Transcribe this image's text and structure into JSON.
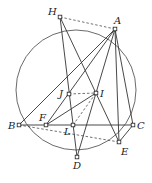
{
  "diagram": {
    "circle": {
      "cx": 76,
      "cy": 90,
      "r": 60
    },
    "points": [
      {
        "id": "H",
        "label": "H",
        "x": 60,
        "y": 17,
        "lx": 48,
        "ly": 15
      },
      {
        "id": "A",
        "label": "A",
        "x": 115,
        "y": 29,
        "lx": 114,
        "ly": 24
      },
      {
        "id": "J",
        "label": "J",
        "x": 69,
        "y": 94,
        "lx": 59,
        "ly": 97
      },
      {
        "id": "I",
        "label": "I",
        "x": 96,
        "y": 93,
        "lx": 100,
        "ly": 97
      },
      {
        "id": "B",
        "label": "B",
        "x": 19,
        "y": 125,
        "lx": 8,
        "ly": 129
      },
      {
        "id": "F",
        "label": "F",
        "x": 46,
        "y": 125,
        "lx": 39,
        "ly": 121
      },
      {
        "id": "L",
        "label": "L",
        "x": 73,
        "y": 125,
        "lx": 64,
        "ly": 135
      },
      {
        "id": "C",
        "label": "C",
        "x": 133,
        "y": 125,
        "lx": 137,
        "ly": 129
      },
      {
        "id": "E",
        "label": "E",
        "x": 119,
        "y": 142,
        "lx": 121,
        "ly": 155
      },
      {
        "id": "D",
        "label": "D",
        "x": 77,
        "y": 157,
        "lx": 73,
        "ly": 169
      }
    ],
    "solid_segments": [
      [
        "A",
        "B"
      ],
      [
        "A",
        "F"
      ],
      [
        "A",
        "D"
      ],
      [
        "A",
        "E"
      ],
      [
        "A",
        "C"
      ],
      [
        "C",
        "E"
      ],
      [
        "H",
        "D"
      ],
      [
        "H",
        "E"
      ],
      [
        "B",
        "C"
      ],
      [
        "F",
        "I"
      ]
    ],
    "dashed_segments": [
      [
        "H",
        "A"
      ],
      [
        "J",
        "I"
      ],
      [
        "B",
        "E"
      ],
      [
        "L",
        "I"
      ]
    ]
  }
}
